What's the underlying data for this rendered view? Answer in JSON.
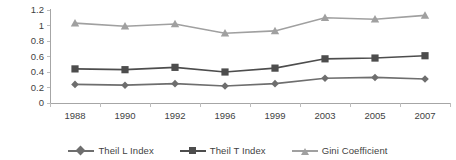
{
  "chart_data": {
    "type": "line",
    "title": "",
    "xlabel": "",
    "ylabel": "",
    "categories": [
      "1988",
      "1990",
      "1992",
      "1996",
      "1999",
      "2003",
      "2005",
      "2007"
    ],
    "ylim": [
      0,
      1.2
    ],
    "ytick_labels": [
      "0",
      "0.2",
      "0.4",
      "0.6",
      "0.8",
      "1",
      "1.2"
    ],
    "ytick_values": [
      0,
      0.2,
      0.4,
      0.6,
      0.8,
      1,
      1.2
    ],
    "grid": false,
    "legend_position": "bottom",
    "series": [
      {
        "name": "Theil L Index",
        "marker": "diamond",
        "color": "#6e6e6e",
        "values": [
          0.24,
          0.23,
          0.25,
          0.22,
          0.25,
          0.32,
          0.33,
          0.31
        ]
      },
      {
        "name": "Theil T Index",
        "marker": "square",
        "color": "#4d4d4d",
        "values": [
          0.44,
          0.43,
          0.46,
          0.4,
          0.45,
          0.57,
          0.58,
          0.61
        ]
      },
      {
        "name": "Gini Coefficient",
        "marker": "triangle",
        "color": "#a0a0a0",
        "values": [
          1.03,
          0.99,
          1.02,
          0.9,
          0.93,
          1.1,
          1.08,
          1.13
        ]
      }
    ]
  },
  "legend": {
    "items": [
      {
        "label": "Theil L Index"
      },
      {
        "label": "Theil T Index"
      },
      {
        "label": "Gini Coefficient"
      }
    ]
  }
}
